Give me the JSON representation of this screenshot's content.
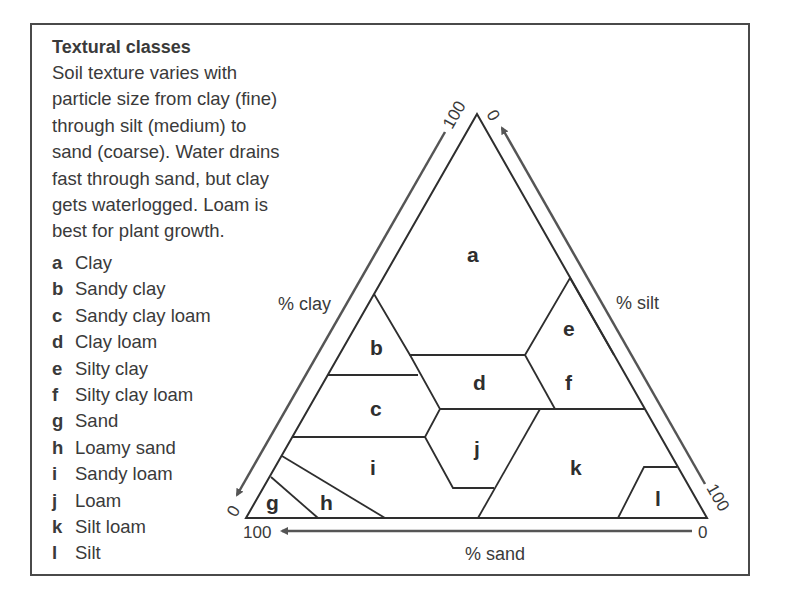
{
  "panel": {
    "title": "Textural classes",
    "description": "Soil texture varies with particle size from clay (fine) through silt (medium) to sand (coarse). Water drains fast through sand, but clay gets waterlogged. Loam is best for plant growth.",
    "description_lines": [
      "Soil texture varies with",
      "particle size from clay (fine)",
      "through silt (medium) to",
      "sand (coarse). Water drains",
      "fast through sand, but clay",
      "gets waterlogged. Loam is",
      "best for plant growth."
    ],
    "legend": [
      {
        "key": "a",
        "label": "Clay"
      },
      {
        "key": "b",
        "label": "Sandy clay"
      },
      {
        "key": "c",
        "label": "Sandy clay loam"
      },
      {
        "key": "d",
        "label": "Clay loam"
      },
      {
        "key": "e",
        "label": "Silty clay"
      },
      {
        "key": "f",
        "label": "Silty clay loam"
      },
      {
        "key": "g",
        "label": "Sand"
      },
      {
        "key": "h",
        "label": "Loamy sand"
      },
      {
        "key": "i",
        "label": "Sandy loam"
      },
      {
        "key": "j",
        "label": "Loam"
      },
      {
        "key": "k",
        "label": "Silt loam"
      },
      {
        "key": "l",
        "label": "Silt"
      }
    ]
  },
  "diagram": {
    "type": "soil-texture-triangle",
    "axes": {
      "clay": {
        "label": "% clay",
        "start": "100",
        "end": "0"
      },
      "silt": {
        "label": "% silt",
        "start": "0",
        "end": "100"
      },
      "sand": {
        "label": "% sand",
        "start": "0",
        "end": "100"
      }
    },
    "regions": [
      "a",
      "b",
      "c",
      "d",
      "e",
      "f",
      "g",
      "h",
      "i",
      "j",
      "k",
      "l"
    ],
    "colors": {
      "line": "#2e2e2e",
      "arrow": "#555555",
      "frame": "#4a4a4a",
      "text": "#3a3a3a"
    }
  }
}
